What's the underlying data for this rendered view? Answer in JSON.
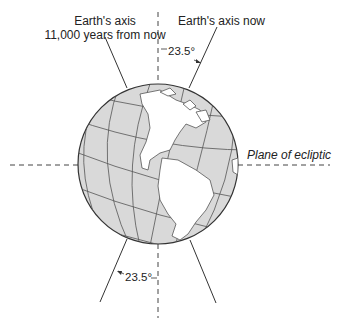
{
  "labels": {
    "future_axis_line1": "Earth's axis",
    "future_axis_line2": "11,000 years from now",
    "current_axis": "Earth's axis now",
    "angle_top": "23.5°",
    "angle_bottom": "23.5°",
    "plane": "Plane of ecliptic"
  },
  "colors": {
    "globe_fill": "#d9d9d9",
    "land_fill": "#ffffff",
    "line": "#333333"
  }
}
